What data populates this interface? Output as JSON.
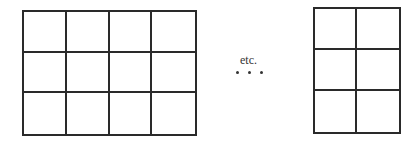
{
  "left_grid": {
    "rows": 3,
    "cols": 4,
    "x": 22,
    "y": 10,
    "width": 175,
    "height": 126
  },
  "right_grid": {
    "rows": 3,
    "cols": 2,
    "x": 313,
    "y": 7,
    "width": 88,
    "height": 127
  },
  "ellipsis": {
    "text": "etc.",
    "dots": 3
  },
  "colors": {
    "line": "#2a2a2a",
    "text": "#333333"
  }
}
